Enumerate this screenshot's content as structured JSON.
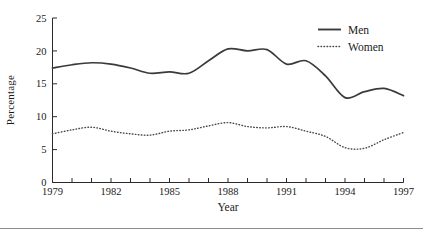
{
  "chart_data": {
    "type": "line",
    "title": "",
    "xlabel": "Year",
    "ylabel": "Percentage",
    "x": [
      1979,
      1980,
      1981,
      1982,
      1983,
      1984,
      1985,
      1986,
      1987,
      1988,
      1989,
      1990,
      1991,
      1992,
      1993,
      1994,
      1995,
      1996,
      1997
    ],
    "xlim": [
      1979,
      1997
    ],
    "ylim": [
      0,
      25
    ],
    "yticks": [
      0,
      5,
      10,
      15,
      20,
      25
    ],
    "ytick_labels": [
      "0",
      "5",
      "10",
      "15",
      "20",
      "25"
    ],
    "xticks": [
      1979,
      1980,
      1981,
      1982,
      1983,
      1984,
      1985,
      1986,
      1987,
      1988,
      1989,
      1990,
      1991,
      1992,
      1993,
      1994,
      1995,
      1996,
      1997
    ],
    "xtick_labels_shown": [
      "1979",
      "1982",
      "1985",
      "1988",
      "1991",
      "1994",
      "1997"
    ],
    "xtick_label_years": [
      1979,
      1982,
      1985,
      1988,
      1991,
      1994,
      1997
    ],
    "grid": false,
    "legend_position": "top-right",
    "series": [
      {
        "name": "Men",
        "style": "solid",
        "color": "#3a3a3a",
        "values": [
          17.4,
          17.9,
          18.2,
          18.0,
          17.4,
          16.6,
          16.8,
          16.6,
          18.5,
          20.3,
          20.0,
          20.2,
          18.0,
          18.5,
          16.2,
          12.9,
          13.8,
          14.3,
          13.2
        ]
      },
      {
        "name": "Women",
        "style": "dotted",
        "color": "#4a4a4a",
        "values": [
          7.4,
          8.0,
          8.4,
          7.8,
          7.4,
          7.2,
          7.8,
          8.0,
          8.6,
          9.1,
          8.5,
          8.3,
          8.5,
          7.8,
          7.0,
          5.3,
          5.2,
          6.5,
          7.6
        ]
      }
    ]
  },
  "legend": {
    "items": [
      {
        "label": "Men"
      },
      {
        "label": "Women"
      }
    ]
  },
  "axes": {
    "y_title": "Percentage",
    "x_title": "Year"
  }
}
